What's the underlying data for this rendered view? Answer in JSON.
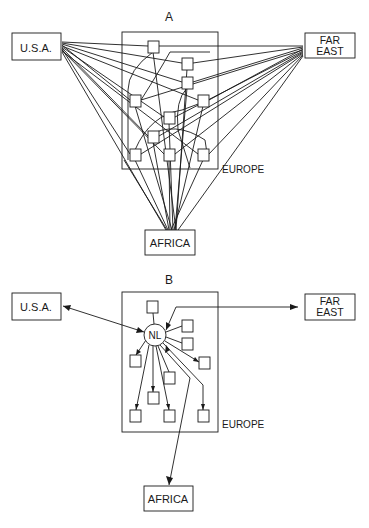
{
  "diagram_a": {
    "title": "A",
    "nodes": {
      "usa": "U.S.A.",
      "far_east_line1": "FAR",
      "far_east_line2": "EAST",
      "africa": "AFRICA",
      "europe": "EUROPE"
    },
    "description": "Every European location connected directly to U.S.A., FAR EAST and AFRICA"
  },
  "diagram_b": {
    "title": "B",
    "hub": "NL",
    "nodes": {
      "usa": "U.S.A.",
      "far_east_line1": "FAR",
      "far_east_line2": "EAST",
      "africa": "AFRICA",
      "europe": "EUROPE"
    },
    "description": "All flows routed through a central NL hub"
  },
  "colors": {
    "ink": "#1a1a1a",
    "background": "#ffffff"
  }
}
